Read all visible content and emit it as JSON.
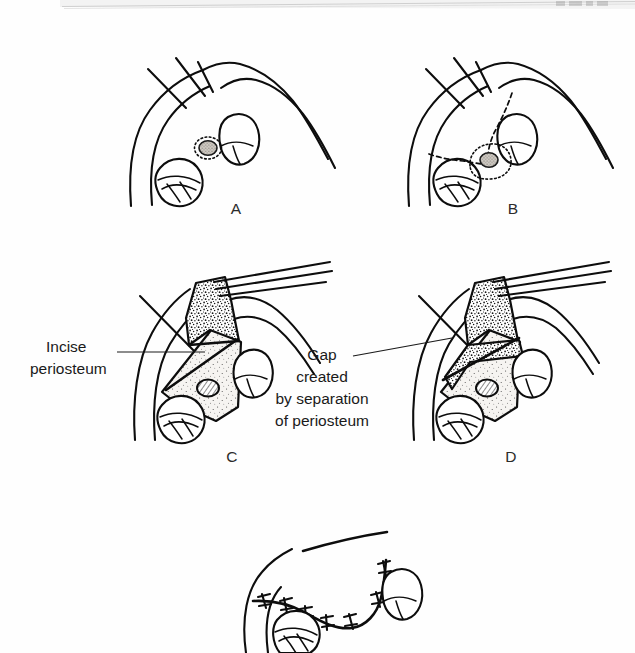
{
  "figure": {
    "kind": "medical-illustration",
    "background_color": "#ffffff",
    "ink_color": "#0d0d0d",
    "flap_fill_color": "#f2f0ec",
    "nerve_fill_color": "#b9b4ad"
  },
  "scan_artifact": {
    "present": true,
    "description": "faint grey scanned page edge band across the top",
    "band_color": "#e9e9e9"
  },
  "panels": [
    {
      "id": "A",
      "label": "A",
      "label_x": 236,
      "label_y": 214,
      "caption": "",
      "description": "Intact mucosa over bone showing two teeth in cross-section and a shaded nerve bundle outlined by a dotted ring"
    },
    {
      "id": "B",
      "label": "B",
      "label_x": 513,
      "label_y": 214,
      "caption": "",
      "description": "Dashed lines mark the planned incision outlining the flap around the nerve bundle"
    },
    {
      "id": "C",
      "label": "C",
      "label_x": 232,
      "label_y": 462,
      "caption": "",
      "description": "Flap raised and held with a retractor; stippled periosteum is being incised"
    },
    {
      "id": "D",
      "label": "D",
      "label_x": 511,
      "label_y": 462,
      "caption": "",
      "description": "Flap advanced showing the gap produced where periosteum was separated"
    },
    {
      "id": "E",
      "label": "",
      "label_x": 0,
      "label_y": 0,
      "caption": "",
      "description": "Closure with interrupted sutures along the advanced flap margin (partially cropped at the bottom edge)"
    }
  ],
  "annotations": [
    {
      "name": "incise-periosteum",
      "lines": [
        "Incise",
        "periosteum"
      ],
      "text_x": 46,
      "text_y": 352,
      "align": "start",
      "leader": {
        "x1": 117,
        "y1": 352,
        "x2": 205,
        "y2": 352
      }
    },
    {
      "name": "gap-created-by-separation-of-periosteum",
      "lines": [
        "Gap",
        "created",
        "by separation",
        "of periosteum"
      ],
      "text_x": 322,
      "text_y": 360,
      "align": "middle",
      "leader": {
        "x1": 353,
        "y1": 356,
        "x2": 452,
        "y2": 338
      }
    }
  ],
  "colors": {
    "ink": "#0d0d0d",
    "text": "#1a1a1a",
    "label": "#2b2b2b",
    "flap_light": "#f2f0ec",
    "nerve": "#b9b4ad",
    "paper": "#ffffff"
  }
}
